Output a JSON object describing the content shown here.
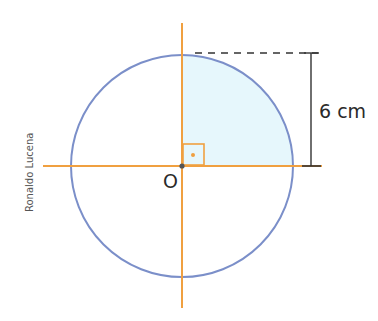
{
  "diagram": {
    "center_label": "O",
    "radius_label": "6 cm",
    "credit": "Ronaldo Lucena",
    "colors": {
      "circle": "#7b8fc9",
      "axes": "#f0a040",
      "shaded_sector": "#e6f7fc",
      "dimension": "#333333",
      "center_dot": "#555555"
    },
    "shapes": {
      "circle": {
        "cx": 182,
        "cy": 166,
        "r": 111
      },
      "shaded": "upper-right quarter",
      "right_angle_marker": true
    }
  }
}
